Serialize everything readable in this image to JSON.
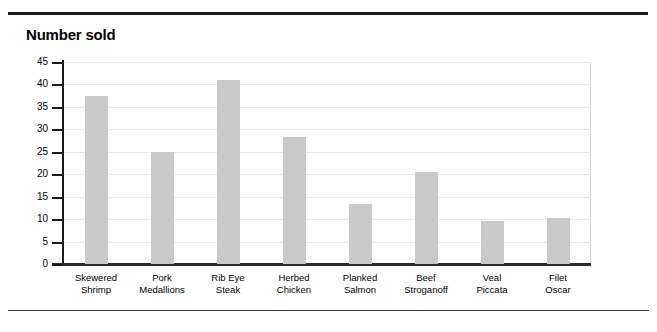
{
  "title": "Number sold",
  "colors": {
    "bar_fill": "#c9c9c9",
    "axis": "#1a1a1a",
    "gridline": "#e8e8e8",
    "rule": "#1a1a1a",
    "text": "#000000"
  },
  "chart_data": {
    "type": "bar",
    "title": "Number sold",
    "xlabel": "",
    "ylabel": "Number sold",
    "ylim": [
      0,
      45
    ],
    "y_ticks": [
      0,
      5,
      10,
      15,
      20,
      25,
      30,
      35,
      40,
      45
    ],
    "grid": true,
    "legend": null,
    "categories": [
      "Skewered Shrimp",
      "Pork Medallions",
      "Rib Eye Steak",
      "Herbed Chicken",
      "Planked Salmon",
      "Beef Stroganoff",
      "Veal Piccata",
      "Filet Oscar"
    ],
    "category_lines": [
      [
        "Skewered",
        "Shrimp"
      ],
      [
        "Pork",
        "Medallions"
      ],
      [
        "Rib Eye",
        "Steak"
      ],
      [
        "Herbed",
        "Chicken"
      ],
      [
        "Planked",
        "Salmon"
      ],
      [
        "Beef",
        "Stroganoff"
      ],
      [
        "Veal",
        "Piccata"
      ],
      [
        "Filet",
        "Oscar"
      ]
    ],
    "values": [
      37.5,
      25,
      41,
      28.3,
      13.4,
      20.5,
      9.5,
      10.3
    ]
  }
}
